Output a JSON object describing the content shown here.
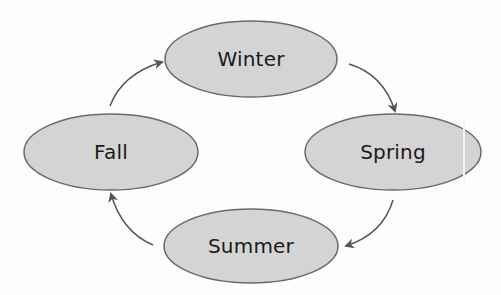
{
  "diagram": {
    "type": "cycle",
    "colors": {
      "node_fill": "#d4d4d4",
      "node_stroke": "#6a6a6a",
      "arrow": "#555555",
      "text": "#1a1a1a",
      "background": "#ffffff"
    },
    "nodes": [
      {
        "id": "winter",
        "label": "Winter",
        "cx": 251,
        "cy": 59,
        "rx": 86,
        "ry": 38
      },
      {
        "id": "spring",
        "label": "Spring",
        "cx": 393,
        "cy": 152,
        "rx": 88,
        "ry": 38
      },
      {
        "id": "summer",
        "label": "Summer",
        "cx": 251,
        "cy": 246,
        "rx": 87,
        "ry": 37
      },
      {
        "id": "fall",
        "label": "Fall",
        "cx": 111,
        "cy": 152,
        "rx": 87,
        "ry": 38
      }
    ],
    "edges": [
      {
        "from": "fall",
        "to": "winter"
      },
      {
        "from": "winter",
        "to": "spring"
      },
      {
        "from": "spring",
        "to": "summer"
      },
      {
        "from": "summer",
        "to": "fall"
      }
    ]
  }
}
